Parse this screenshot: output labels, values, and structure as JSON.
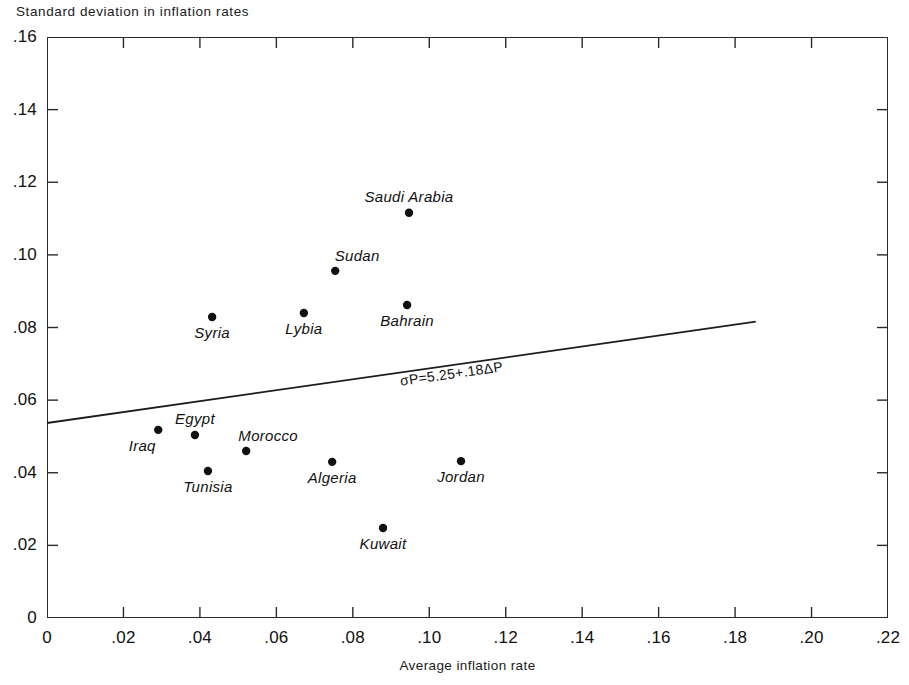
{
  "chart_data": {
    "type": "scatter",
    "title": "",
    "ylabel": "Standard deviation in inflation rates",
    "xlabel": "Average inflation rate",
    "xlim": [
      0,
      0.22
    ],
    "ylim": [
      0,
      0.16
    ],
    "xticks": [
      "0",
      ".02",
      ".04",
      ".06",
      ".08",
      ".10",
      ".12",
      ".14",
      ".16",
      ".18",
      ".20",
      ".22"
    ],
    "xtick_values": [
      0,
      0.02,
      0.04,
      0.06,
      0.08,
      0.1,
      0.12,
      0.14,
      0.16,
      0.18,
      0.2,
      0.22
    ],
    "yticks": [
      "0",
      ".02",
      ".04",
      ".06",
      ".08",
      ".10",
      ".12",
      ".14",
      ".16"
    ],
    "ytick_values": [
      0,
      0.02,
      0.04,
      0.06,
      0.08,
      0.1,
      0.12,
      0.14,
      0.16
    ],
    "grid": false,
    "legend": null,
    "points": [
      {
        "label": "Saudi Arabia",
        "x": 0.0947,
        "y": 0.1116,
        "label_pos": "above"
      },
      {
        "label": "Sudan",
        "x": 0.0754,
        "y": 0.0956,
        "label_pos": "above-right"
      },
      {
        "label": "Bahrain",
        "x": 0.0942,
        "y": 0.0862,
        "label_pos": "below"
      },
      {
        "label": "Syria",
        "x": 0.0432,
        "y": 0.0829,
        "label_pos": "below"
      },
      {
        "label": "Lybia",
        "x": 0.0672,
        "y": 0.084,
        "label_pos": "below"
      },
      {
        "label": "Iraq",
        "x": 0.0291,
        "y": 0.0518,
        "label_pos": "below-left"
      },
      {
        "label": "Egypt",
        "x": 0.0387,
        "y": 0.0504,
        "label_pos": "above"
      },
      {
        "label": "Morocco",
        "x": 0.0521,
        "y": 0.046,
        "label_pos": "above-right"
      },
      {
        "label": "Tunisia",
        "x": 0.0421,
        "y": 0.0405,
        "label_pos": "below"
      },
      {
        "label": "Algeria",
        "x": 0.0746,
        "y": 0.043,
        "label_pos": "below"
      },
      {
        "label": "Jordan",
        "x": 0.1083,
        "y": 0.0432,
        "label_pos": "below"
      },
      {
        "label": "Kuwait",
        "x": 0.0879,
        "y": 0.0248,
        "label_pos": "below"
      }
    ],
    "trend_line": {
      "annotation": "σP=5.25+.18ΔP",
      "intercept": 0.0525,
      "slope": 0.18,
      "x_start": 0.0,
      "y_start": 0.0537,
      "x_end": 0.1854,
      "y_end": 0.0816
    }
  }
}
